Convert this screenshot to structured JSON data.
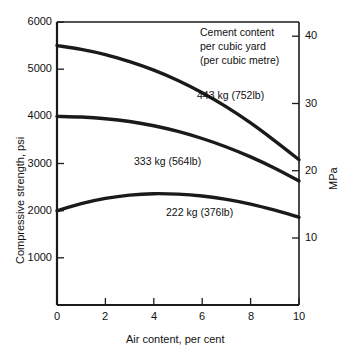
{
  "chart_data": {
    "type": "line",
    "title": "",
    "xlabel": "Air content, per cent",
    "ylabel": "Compressive strength, psi",
    "ylabel_right": "MPa",
    "xlim": [
      0,
      10
    ],
    "ylim": [
      0,
      6000
    ],
    "ylim_right": [
      0,
      41.37
    ],
    "grid": false,
    "legend_position": "inline-annotations",
    "xticks": [
      "0",
      "2",
      "4",
      "6",
      "8",
      "10"
    ],
    "xtick_values": [
      0,
      2,
      4,
      6,
      8,
      10
    ],
    "yticks": [
      "1000",
      "2000",
      "3000",
      "4000",
      "5000",
      "6000"
    ],
    "ytick_values": [
      1000,
      2000,
      3000,
      4000,
      5000,
      6000
    ],
    "yticks_right": [
      "10",
      "20",
      "30",
      "40"
    ],
    "ytick_values_right": [
      10,
      20,
      30,
      40
    ],
    "annotation_block": [
      "Cement content",
      "per cubic yard",
      "(per cubic metre)"
    ],
    "series": [
      {
        "name": "443 kg (752lb)",
        "label": "443 kg (752lb)",
        "x": [
          0,
          1,
          2,
          3,
          4,
          5,
          6,
          7,
          8,
          9,
          10
        ],
        "values": [
          5500,
          5420,
          5310,
          5160,
          4980,
          4760,
          4500,
          4200,
          3860,
          3480,
          3080
        ]
      },
      {
        "name": "333 kg (564lb)",
        "label": "333 kg (564lb)",
        "x": [
          0,
          1,
          2,
          3,
          4,
          5,
          6,
          7,
          8,
          9,
          10
        ],
        "values": [
          4000,
          3985,
          3950,
          3890,
          3800,
          3680,
          3530,
          3350,
          3140,
          2900,
          2630
        ]
      },
      {
        "name": "222 kg (376lb)",
        "label": "222 kg (376lb)",
        "x": [
          0,
          1,
          2,
          3,
          4,
          5,
          6,
          7,
          8,
          9,
          10
        ],
        "values": [
          2000,
          2150,
          2260,
          2330,
          2360,
          2350,
          2310,
          2240,
          2140,
          2010,
          1860
        ]
      }
    ],
    "colors": {
      "curve": "#1a1a1a",
      "axis": "#1a1a1a",
      "background": "#ffffff",
      "text": "#111111"
    }
  },
  "axes": {
    "left": {
      "title": "Compressive strength, psi",
      "ticks": [
        "6000",
        "5000",
        "4000",
        "3000",
        "2000",
        "1000"
      ]
    },
    "right": {
      "title": "MPa",
      "ticks": [
        "40",
        "30",
        "20",
        "10"
      ]
    },
    "bottom": {
      "title": "Air content, per cent",
      "ticks": [
        "0",
        "2",
        "4",
        "6",
        "8",
        "10"
      ]
    }
  },
  "annotations": {
    "cement_heading_line1": "Cement content",
    "cement_heading_line2": "per cubic yard",
    "cement_heading_line3": "(per cubic metre)",
    "curve_label_top": "443 kg (752lb)",
    "curve_label_mid": "333 kg (564lb)",
    "curve_label_bottom": "222 kg (376lb)"
  }
}
